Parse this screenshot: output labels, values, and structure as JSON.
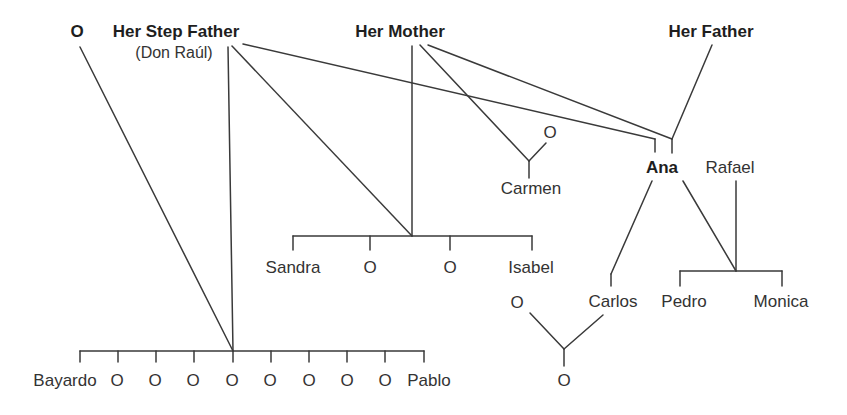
{
  "colors": {
    "line": "#3a3a3a",
    "text": "#333333",
    "bold_text": "#1e1e1e",
    "background": "#ffffff"
  },
  "people": {
    "unknown_spouse_top": "O",
    "step_father": "Her Step Father",
    "step_father_name": "(Don Raúl)",
    "mother": "Her Mother",
    "father": "Her Father",
    "mothers_partner_o": "O",
    "carmen": "Carmen",
    "ana": "Ana",
    "rafael": "Rafael",
    "sandra": "Sandra",
    "mid_o1": "O",
    "mid_o2": "O",
    "isabel": "Isabel",
    "carlos_partner": "O",
    "carlos": "Carlos",
    "pedro": "Pedro",
    "monica": "Monica",
    "carlos_child": "O",
    "bottom_children": [
      "Bayardo",
      "O",
      "O",
      "O",
      "O",
      "O",
      "O",
      "O",
      "O",
      "Pablo"
    ]
  },
  "relations": [
    {
      "parents": [
        "O",
        "Her Step Father"
      ],
      "children": [
        "Bayardo",
        "O",
        "O",
        "O",
        "O",
        "O",
        "O",
        "O",
        "O",
        "Pablo"
      ]
    },
    {
      "parents": [
        "Her Step Father",
        "Her Mother"
      ],
      "children": [
        "Sandra",
        "O",
        "O",
        "Isabel"
      ]
    },
    {
      "parents": [
        "Her Mother",
        "O"
      ],
      "children": [
        "Carmen"
      ]
    },
    {
      "parents": [
        "Her Mother",
        "Her Father"
      ],
      "children": [
        "Ana"
      ]
    },
    {
      "parents": [
        "Her Step Father"
      ],
      "raised": [
        "Ana"
      ]
    },
    {
      "parents": [
        "Ana",
        "Rafael"
      ],
      "children": [
        "Pedro",
        "Monica"
      ]
    },
    {
      "parents": [
        "Ana"
      ],
      "children": [
        "Carlos"
      ]
    },
    {
      "parents": [
        "O",
        "Carlos"
      ],
      "children": [
        "O"
      ]
    }
  ]
}
